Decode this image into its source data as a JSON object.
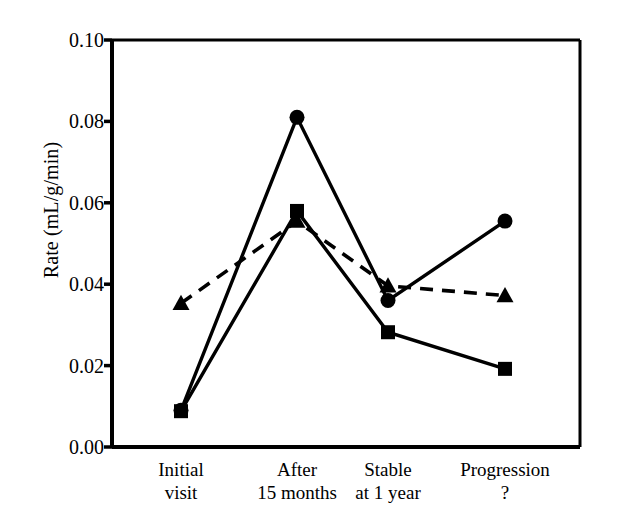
{
  "chart_data": {
    "type": "line",
    "title": "",
    "subtitle": "",
    "xlabel": "",
    "ylabel": "Rate (mL/g/min)",
    "categories": [
      "Initial visit",
      "After 15 months",
      "Stable at 1 year",
      "Progression ?"
    ],
    "category_lines": [
      [
        "Initial",
        "visit"
      ],
      [
        "After",
        "15 months"
      ],
      [
        "Stable",
        "at 1 year"
      ],
      [
        "Progression",
        "?"
      ]
    ],
    "ylim": [
      0.0,
      0.1
    ],
    "yticks": [
      0.0,
      0.02,
      0.04,
      0.06,
      0.08,
      0.1
    ],
    "ytick_labels": [
      "0.00",
      "0.02",
      "0.04",
      "0.06",
      "0.08",
      "0.10"
    ],
    "grid": false,
    "legend": "none",
    "series": [
      {
        "name": "circle-series",
        "marker": "circle",
        "linestyle": "solid",
        "color": "#000000",
        "values": [
          0.009,
          0.081,
          0.036,
          0.0555
        ]
      },
      {
        "name": "square-series",
        "marker": "square",
        "linestyle": "solid",
        "color": "#000000",
        "values": [
          0.0088,
          0.058,
          0.0282,
          0.0192
        ]
      },
      {
        "name": "triangle-series",
        "marker": "triangle",
        "linestyle": "dashed",
        "color": "#000000",
        "values": [
          0.0353,
          0.0555,
          0.0396,
          0.0372
        ]
      }
    ]
  },
  "axes": {
    "ylabel": "Rate (mL/g/min)"
  }
}
